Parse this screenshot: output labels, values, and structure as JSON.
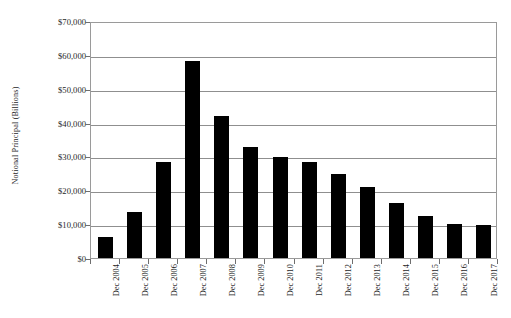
{
  "chart_data": {
    "type": "bar",
    "title": "",
    "subtitle": "",
    "xlabel": "",
    "ylabel": "Notional Principal (Billions)",
    "categories": [
      "Dec 2004",
      "Dec 2005",
      "Dec 2006",
      "Dec 2007",
      "Dec 2008",
      "Dec 2009",
      "Dec 2010",
      "Dec 2011",
      "Dec 2012",
      "Dec 2013",
      "Dec 2014",
      "Dec 2015",
      "Dec 2016",
      "Dec 2017"
    ],
    "values": [
      6300,
      13700,
      28300,
      58200,
      41900,
      32700,
      29900,
      28500,
      24700,
      21000,
      16400,
      12300,
      10000,
      9700
    ],
    "ylim": [
      0,
      70000
    ],
    "ytick_values": [
      0,
      10000,
      20000,
      30000,
      40000,
      50000,
      60000,
      70000
    ],
    "ytick_labels": [
      "$0",
      "$10,000",
      "$20,000",
      "$30,000",
      "$40,000",
      "$50,000",
      "$60,000",
      "$70,000"
    ],
    "grid": true,
    "grid_axis": "y",
    "legend": false,
    "legend_position": "none",
    "bar_color": "#000000",
    "gridline_color": "#8f8f8f",
    "frame_color": "#9a9a9a",
    "background_color": "#ffffff",
    "xtick_rotation": -90,
    "annotations": []
  }
}
